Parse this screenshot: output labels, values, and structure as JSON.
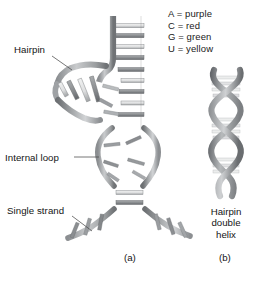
{
  "figure": {
    "background_color": "#ffffff",
    "legend": {
      "name": "base-color-key",
      "entries": [
        "A = purple",
        "C = red",
        "G = green",
        "U = yellow"
      ]
    },
    "callouts": {
      "hairpin": "Hairpin",
      "internal_loop": "Internal loop",
      "single_strand": "Single strand"
    },
    "panel_a": {
      "label": "(a)",
      "description": "RNA secondary structure with hairpin, internal loop and single strands"
    },
    "panel_b": {
      "label": "(b)",
      "caption_lines": [
        "Hairpin",
        "double",
        "helix"
      ]
    },
    "colors": {
      "strand_dark": "#6e7174",
      "strand_mid": "#8e9194",
      "strand_light": "#c3c6c8",
      "rung_light": "#e8e9ea",
      "rung_mid": "#a9acae",
      "outline": "#5a5d60",
      "leader_line": "#4a4a4a",
      "text": "#141414"
    }
  }
}
